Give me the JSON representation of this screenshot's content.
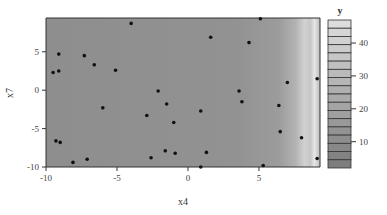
{
  "chart_data": {
    "type": "heatmap",
    "title": "",
    "xlabel": "x4",
    "ylabel": "x7",
    "xlim": [
      -10,
      9.3
    ],
    "ylim": [
      -10,
      9.4
    ],
    "x_ticks": [
      -10,
      -5,
      0,
      5
    ],
    "y_ticks": [
      -10,
      -5,
      0,
      5
    ],
    "grid": false,
    "colorbar": {
      "title": "y",
      "range": [
        2,
        47
      ],
      "ticks": [
        10,
        20,
        30,
        40
      ],
      "n_bands": 18,
      "position": "right"
    },
    "surface_description": "Nearly uniform mid-gray (low y) across most of x4, brightening sharply for x4 > ~7.5 (high y values near right edge)",
    "points": [
      {
        "x": -4.0,
        "y": 8.7
      },
      {
        "x": -9.1,
        "y": 4.7
      },
      {
        "x": -7.3,
        "y": 4.5
      },
      {
        "x": -6.6,
        "y": 3.3
      },
      {
        "x": -9.5,
        "y": 2.3
      },
      {
        "x": -9.1,
        "y": 2.5
      },
      {
        "x": -5.1,
        "y": 2.6
      },
      {
        "x": 1.6,
        "y": 6.9
      },
      {
        "x": 4.3,
        "y": 6.2
      },
      {
        "x": 5.1,
        "y": 9.3
      },
      {
        "x": 9.1,
        "y": 1.5
      },
      {
        "x": 7.0,
        "y": 1.0
      },
      {
        "x": -2.1,
        "y": -0.1
      },
      {
        "x": -1.5,
        "y": -1.8
      },
      {
        "x": 3.6,
        "y": -0.1
      },
      {
        "x": 3.8,
        "y": -1.5
      },
      {
        "x": 6.4,
        "y": -2.0
      },
      {
        "x": -6.0,
        "y": -2.3
      },
      {
        "x": 0.9,
        "y": -2.7
      },
      {
        "x": -2.9,
        "y": -3.3
      },
      {
        "x": -1.0,
        "y": -4.2
      },
      {
        "x": -9.3,
        "y": -6.6
      },
      {
        "x": -9.0,
        "y": -6.8
      },
      {
        "x": -1.6,
        "y": -7.9
      },
      {
        "x": -0.9,
        "y": -8.2
      },
      {
        "x": 6.5,
        "y": -5.4
      },
      {
        "x": 8.0,
        "y": -6.2
      },
      {
        "x": -2.6,
        "y": -8.8
      },
      {
        "x": -7.1,
        "y": -9.0
      },
      {
        "x": -8.1,
        "y": -9.4
      },
      {
        "x": 1.3,
        "y": -8.1
      },
      {
        "x": 5.3,
        "y": -9.8
      },
      {
        "x": 0.9,
        "y": -10.0
      },
      {
        "x": 9.1,
        "y": -8.9
      }
    ]
  }
}
